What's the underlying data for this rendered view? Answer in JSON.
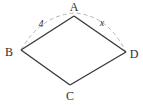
{
  "diagram": {
    "type": "geometry-quadrilateral-with-compass-arc",
    "vertices": {
      "A": {
        "label": "A"
      },
      "B": {
        "label": "B"
      },
      "C": {
        "label": "C"
      },
      "D": {
        "label": "D"
      }
    },
    "arc_labels": {
      "left": "4",
      "right": "x"
    },
    "colors": {
      "edge": "#3a3a3a",
      "arc": "#b4b4b4",
      "text": "#2e2e2e",
      "background": "#ffffff"
    }
  }
}
